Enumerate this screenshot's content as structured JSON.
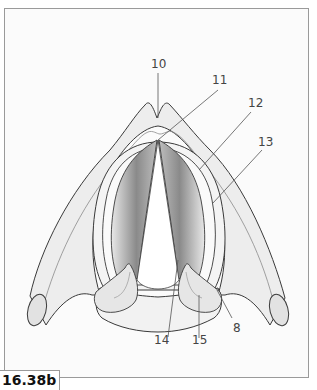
{
  "figure": {
    "label": "16.38b"
  },
  "callouts": [
    {
      "id": "10",
      "text": "10"
    },
    {
      "id": "11",
      "text": "11"
    },
    {
      "id": "12",
      "text": "12"
    },
    {
      "id": "13",
      "text": "13"
    },
    {
      "id": "8",
      "text": "8"
    },
    {
      "id": "14",
      "text": "14"
    },
    {
      "id": "15",
      "text": "15"
    }
  ],
  "colors": {
    "line": "#3a3a3a",
    "leader": "#555555",
    "fill_light": "#ececec",
    "fill_dark": "#7a7a7a",
    "border": "#9a9a9a"
  }
}
